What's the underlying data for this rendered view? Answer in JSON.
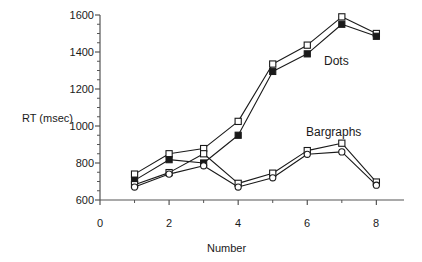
{
  "chart_data": {
    "type": "line",
    "title": "",
    "xlabel": "Number",
    "ylabel": "RT (msec)",
    "xlim": [
      0,
      8.8
    ],
    "ylim": [
      600,
      1600
    ],
    "grid": false,
    "legend_position": "inline-annotations",
    "x_ticks": [
      0,
      2,
      4,
      6,
      8
    ],
    "x_tick_labels": [
      "0",
      "2",
      "4",
      "6",
      "8"
    ],
    "x_minor_ticks": [
      1,
      3,
      5,
      7
    ],
    "y_ticks": [
      600,
      800,
      1000,
      1200,
      1400,
      1600
    ],
    "y_tick_labels": [
      "600",
      "800",
      "1000",
      "1200",
      "1400",
      "1600"
    ],
    "y_minor_interval": 50,
    "x": [
      1,
      2,
      3,
      4,
      5,
      6,
      7,
      8
    ],
    "annotations": [
      {
        "text": "Dots",
        "x": 6.55,
        "y": 1430
      },
      {
        "text": "Bargraphs",
        "x": 6.1,
        "y": 1025
      }
    ],
    "series": [
      {
        "name": "Dots open",
        "marker": "open-square",
        "group": "Dots",
        "values": [
          740,
          850,
          878,
          1025,
          1335,
          1437,
          1590,
          1500
        ]
      },
      {
        "name": "Dots filled",
        "marker": "filled-square",
        "group": "Dots",
        "values": [
          706,
          818,
          800,
          950,
          1295,
          1390,
          1550,
          1485
        ]
      },
      {
        "name": "Bargraphs open",
        "marker": "open-square",
        "group": "Bargraphs",
        "values": [
          683,
          748,
          850,
          690,
          745,
          867,
          907,
          697
        ]
      },
      {
        "name": "Bargraphs filled",
        "marker": "open-circle",
        "group": "Bargraphs",
        "values": [
          670,
          740,
          785,
          670,
          720,
          847,
          860,
          680
        ]
      }
    ],
    "colors": {
      "line": "#1a1a1a",
      "marker_fill_open": "#ffffff",
      "marker_fill_solid": "#1a1a1a",
      "axis": "#555555",
      "background": "#ffffff"
    }
  }
}
